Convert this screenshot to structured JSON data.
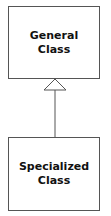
{
  "diagram": {
    "type": "uml-generalization",
    "general_class": {
      "line1": "General",
      "line2": "Class"
    },
    "specialized_class": {
      "line1": "Specialized",
      "line2": "Class"
    },
    "relationship": "inheritance-arrow",
    "colors": {
      "stroke": "#555555",
      "text": "#111111",
      "background": "#ffffff"
    }
  }
}
